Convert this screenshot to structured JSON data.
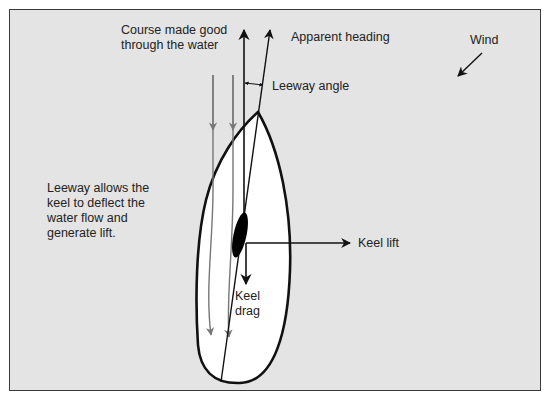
{
  "diagram": {
    "labels": {
      "course": "Course made good\nthrough the water",
      "course_line1": "Course made good",
      "course_line2": "through the water",
      "apparent_heading": "Apparent heading",
      "wind": "Wind",
      "leeway_angle": "Leeway angle",
      "leeway_note_line1": "Leeway allows the",
      "leeway_note_line2": "keel to deflect the",
      "leeway_note_line3": "water flow and",
      "leeway_note_line4": "generate lift.",
      "keel_lift": "Keel lift",
      "keel_drag_line1": "Keel",
      "keel_drag_line2": "drag"
    },
    "colors": {
      "background": "#e4e4e4",
      "frame": "#3a3a3a",
      "hull_fill": "#ffffff",
      "line": "#111111",
      "flow": "#777777",
      "keel": "#000000"
    }
  }
}
